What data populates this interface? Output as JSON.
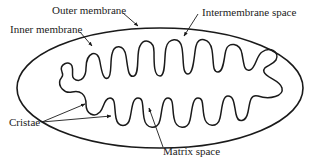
{
  "colors": {
    "stroke": "#1a1a1a",
    "text": "#222222",
    "background": "#ffffff"
  },
  "labels": {
    "outer_membrane": "Outer membrane",
    "intermembrane_space": "Intermembrane space",
    "inner_membrane": "Inner membrane",
    "cristae": "Cristae",
    "matrix_space": "Matrix space"
  }
}
